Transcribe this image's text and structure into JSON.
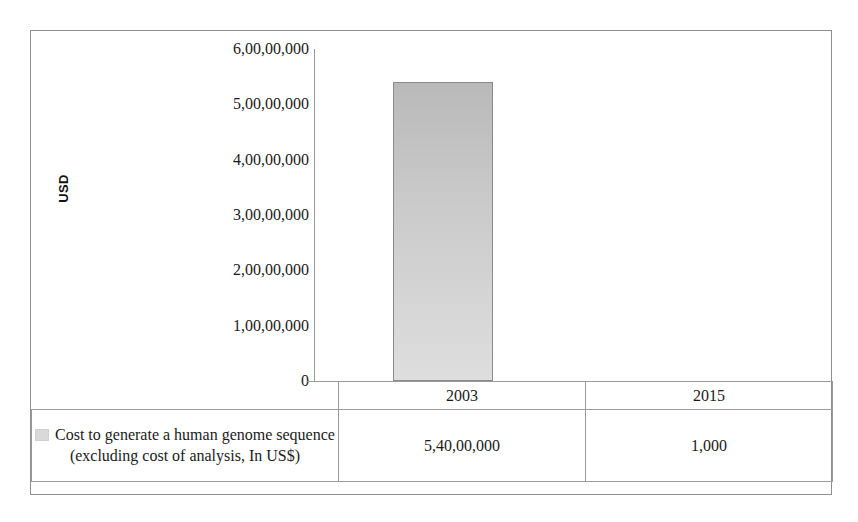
{
  "chart_data": {
    "type": "bar",
    "title": "",
    "subtitle": "",
    "xlabel": "",
    "ylabel": "USD",
    "categories": [
      "2003",
      "2015"
    ],
    "series": [
      {
        "name": "Cost to generate a human genome sequence (excluding cost of analysis, In US$)",
        "values": [
          54000000,
          1000
        ],
        "value_labels": [
          "5,40,00,000",
          "1,000"
        ],
        "color": "#c8c8c8",
        "border_color": "#8a8a8a"
      }
    ],
    "ylim": [
      0,
      60000000
    ],
    "ytick_labels": [
      "6,00,00,000",
      "5,00,00,000",
      "4,00,00,000",
      "3,00,00,000",
      "2,00,00,000",
      "1,00,00,000",
      "0"
    ],
    "ytick_values": [
      60000000,
      50000000,
      40000000,
      30000000,
      20000000,
      10000000,
      0
    ],
    "grid": false,
    "legend_position": "data-table-left",
    "number_format": "indian"
  },
  "axis": {
    "y_title": "USD"
  },
  "legend": {
    "swatch_icon": "legend-swatch-icon",
    "label": "Cost to generate a human genome sequence (excluding cost of analysis, In US$)"
  },
  "table": {
    "header_row": [
      "",
      "2003",
      "2015"
    ],
    "value_row": [
      "Cost to generate a human genome sequence (excluding cost of analysis, In US$)",
      "5,40,00,000",
      "1,000"
    ]
  }
}
